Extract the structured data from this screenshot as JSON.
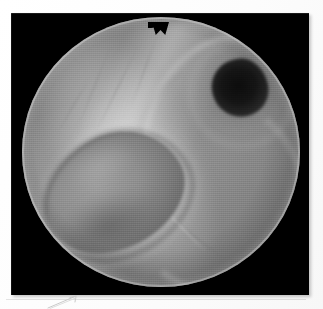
{
  "page": {
    "kind": "scanned-page",
    "background_color": "#fdfdfd"
  },
  "photograph": {
    "name": "endoscopic-photograph",
    "frame_color": "#000000",
    "modality": "endoscopy",
    "color_mode": "grayscale",
    "field_of_view": {
      "shape": "circle",
      "notch_at_top": true,
      "rim_color": "#e8e8e8",
      "vignette": true
    },
    "features": [
      {
        "name": "bronchial-orifice",
        "position": "upper-right",
        "appearance": "dark round opening",
        "color": "#101010"
      },
      {
        "name": "mucosal-mass",
        "position": "lower-left",
        "appearance": "large pale ovoid lobe with dark border",
        "color": "#8e8e8e"
      },
      {
        "name": "mucosal-ridge",
        "position": "center-diagonal",
        "appearance": "bright fold running upper-left to lower-right",
        "color": "#e2e2e2"
      },
      {
        "name": "concentric-folds",
        "position": "right",
        "appearance": "spiral ring-like mucosal folds",
        "color": "#d6d6d6"
      }
    ]
  },
  "annotations": {
    "rule_line": {
      "name": "faint-horizontal-rule",
      "color": "#e6e6e6"
    },
    "pencil_mark": {
      "name": "pencil-arrow-mark",
      "color": "#c8c8c8",
      "description": "faint diagonal pencil stroke"
    }
  }
}
